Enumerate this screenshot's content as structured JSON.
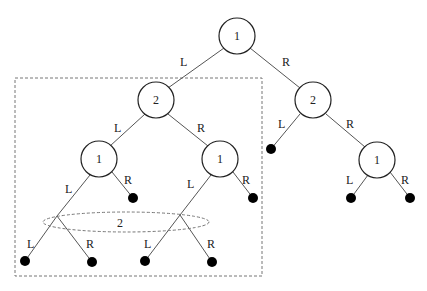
{
  "diagram": {
    "type": "binary decision tree",
    "nodes": [
      {
        "id": "root",
        "label": "1"
      },
      {
        "id": "n2L",
        "label": "2"
      },
      {
        "id": "n2R",
        "label": "2"
      },
      {
        "id": "n1LL",
        "label": "1"
      },
      {
        "id": "n1LR",
        "label": "1"
      },
      {
        "id": "n1RR",
        "label": "1"
      }
    ],
    "edge_labels": {
      "left": "L",
      "right": "R"
    },
    "grouped_label": "2",
    "group_box": "dashed rectangle enclosing left subtree"
  }
}
